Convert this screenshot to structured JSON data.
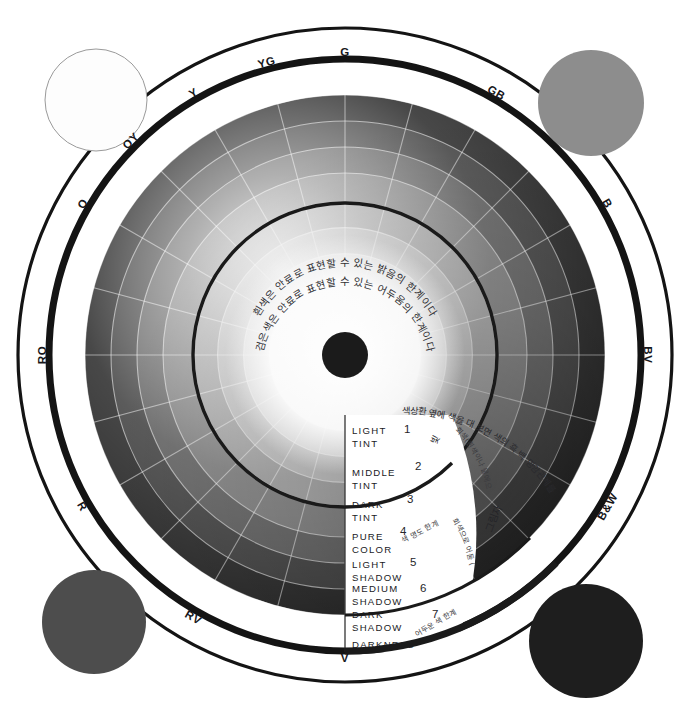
{
  "figure": {
    "center_hub_color": "#1b1b1b",
    "background": "#ffffff",
    "ring_outline_color": "#111111"
  },
  "hue_ring": {
    "labels": [
      {
        "text": "G",
        "angle": 0
      },
      {
        "text": "GB",
        "angle": 30
      },
      {
        "text": "B",
        "angle": 60
      },
      {
        "text": "BV",
        "angle": 90
      },
      {
        "text": "B&W",
        "angle": 120
      },
      {
        "text": "V",
        "angle": 180
      },
      {
        "text": "RV",
        "angle": 210
      },
      {
        "text": "R",
        "angle": 240
      },
      {
        "text": "RO",
        "angle": 270
      },
      {
        "text": "O",
        "angle": 300
      },
      {
        "text": "OY",
        "angle": 315
      },
      {
        "text": "Y",
        "angle": 330
      },
      {
        "text": "YG",
        "angle": 345
      }
    ]
  },
  "value_scale": {
    "rows": [
      {
        "label_line1": "LIGHT",
        "label_line2": "TINT",
        "number": "1"
      },
      {
        "label_line1": "MIDDLE",
        "label_line2": "TINT",
        "number": "2"
      },
      {
        "label_line1": "DARK",
        "label_line2": "TINT",
        "number": "3"
      },
      {
        "label_line1": "PURE",
        "label_line2": "COLOR",
        "number": "4"
      },
      {
        "label_line1": "LIGHT",
        "label_line2": "SHADOW",
        "number": "5"
      },
      {
        "label_line1": "MEDIUM",
        "label_line2": "SHADOW",
        "number": "6"
      },
      {
        "label_line1": "DARK",
        "label_line2": "SHADOW",
        "number": "7"
      },
      {
        "label_line1": "DARKNESS",
        "label_line2": "",
        "number": ""
      }
    ]
  },
  "annotations": {
    "center_outer": "흰색은 안료로 표현할 수 있는 밝음의 한계이다",
    "center_inner": "검은색은 안료로 표현할 수 있는 어두움의 한계이다",
    "light": "빛",
    "shadow": "그림자",
    "tint_desc": "회색(흰색이나 물에으로",
    "shade_desc": "회색으로 어둠 (검은색이나 보색채로)",
    "pure_color_limit": "색 명도 한계",
    "dark_limit": "어두운 색 한계",
    "top_right_long": "색상환 옆에 색을 대 보면 색의 흑 백 명암관계를 알 수 있다"
  },
  "corner_swatches": [
    {
      "name": "white-swatch",
      "color": "#fdfdfd",
      "position": "top-left"
    },
    {
      "name": "mid-gray-swatch",
      "color": "#8d8d8d",
      "position": "top-right"
    },
    {
      "name": "dark-gray-swatch",
      "color": "#4d4d4d",
      "position": "bottom-left"
    },
    {
      "name": "black-swatch",
      "color": "#1e1e1e",
      "position": "bottom-right"
    }
  ],
  "chart_data": {
    "type": "pie",
    "legend_position": "ring",
    "categories": [
      "G",
      "GB",
      "B",
      "BV",
      "B&W",
      "V",
      "RV",
      "R",
      "RO",
      "O",
      "OY",
      "Y",
      "YG"
    ],
    "rings": [
      {
        "name": "LIGHT TINT",
        "step": 1,
        "radius_pct": 29,
        "gray": "#ededed"
      },
      {
        "name": "MIDDLE TINT",
        "step": 2,
        "radius_pct": 39,
        "gray": "#d6d6d6"
      },
      {
        "name": "DARK TINT",
        "step": 3,
        "radius_pct": 49,
        "gray": "#b8b8b8"
      },
      {
        "name": "PURE COLOR",
        "step": 4,
        "radius_pct": 58,
        "gray": "#9c9c9c"
      },
      {
        "name": "LIGHT SHADOW",
        "step": 5,
        "radius_pct": 70,
        "gray": "#787878"
      },
      {
        "name": "MEDIUM SHADOW",
        "step": 6,
        "radius_pct": 80,
        "gray": "#5a5a5a"
      },
      {
        "name": "DARK SHADOW",
        "step": 7,
        "radius_pct": 90,
        "gray": "#3c3c3c"
      },
      {
        "name": "DARKNESS",
        "step": 8,
        "radius_pct": 100,
        "gray": "#252525"
      }
    ],
    "values": [
      1,
      1,
      1,
      1,
      1,
      1,
      1,
      1,
      1,
      1,
      1,
      1,
      1
    ],
    "xlabel": "",
    "ylabel": ""
  }
}
